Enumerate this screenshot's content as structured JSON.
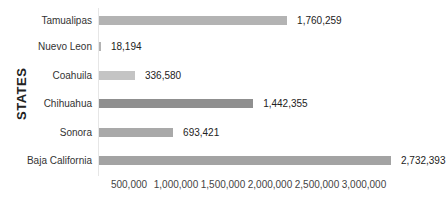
{
  "chart_data": {
    "type": "bar",
    "orientation": "horizontal",
    "title": "",
    "xlabel": "",
    "ylabel": "STATES",
    "categories": [
      "Tamualipas",
      "Nuevo Leon",
      "Coahuila",
      "Chihuahua",
      "Sonora",
      "Baja California"
    ],
    "values": [
      1760259,
      18194,
      336580,
      1442355,
      693421,
      2732393
    ],
    "value_labels": [
      "1,760,259",
      "18,194",
      "336,580",
      "1,442,355",
      "693,421",
      "2,732,393"
    ],
    "bar_colors": [
      "#b3b3b3",
      "#b3b3b3",
      "#c4c4c4",
      "#8f8f8f",
      "#a9a9a9",
      "#a3a3a3"
    ],
    "xlim": [
      0,
      3000000
    ],
    "xticks": [
      500000,
      1000000,
      1500000,
      2000000,
      2500000,
      3000000
    ],
    "xtick_labels": [
      "500,000",
      "1,000,000",
      "1,500,000",
      "2,000,000",
      "2,500,000",
      "3,000,000"
    ],
    "grid": false,
    "legend": null
  }
}
